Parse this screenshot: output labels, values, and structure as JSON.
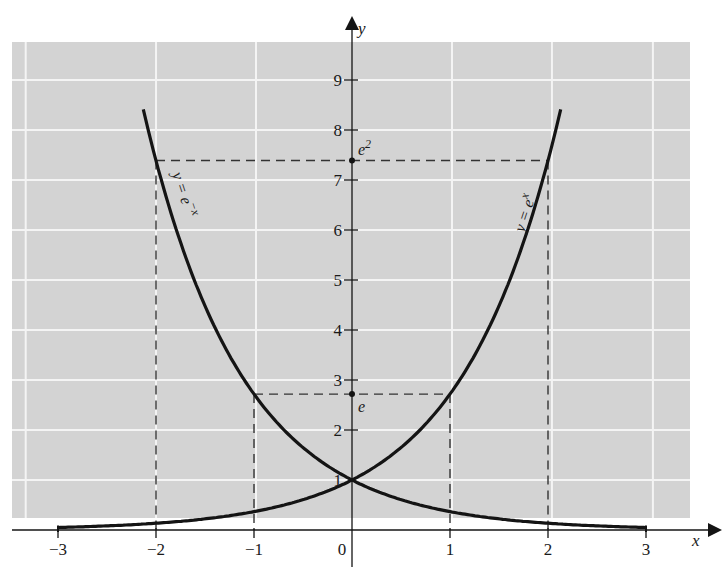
{
  "chart_data": {
    "type": "line",
    "title": "",
    "xlabel": "x",
    "ylabel": "y",
    "xlim": [
      -3,
      3
    ],
    "ylim": [
      0,
      9.5
    ],
    "grid": true,
    "x_ticks": [
      "-3",
      "-2",
      "-1",
      "0",
      "1",
      "2",
      "3"
    ],
    "y_ticks": [
      "1",
      "2",
      "3",
      "4",
      "5",
      "6",
      "7",
      "8",
      "9"
    ],
    "series": [
      {
        "name": "y = e^x",
        "label": "y = e",
        "label_sup": "x",
        "x": [
          -3,
          -2,
          -1,
          0,
          1,
          2,
          2.15
        ],
        "values": [
          0.05,
          0.135,
          0.368,
          1,
          2.718,
          7.389,
          8.6
        ]
      },
      {
        "name": "y = e^-x",
        "label": "y = e",
        "label_sup": "−x",
        "x": [
          -2.15,
          -2,
          -1,
          0,
          1,
          2,
          3
        ],
        "values": [
          8.6,
          7.389,
          2.718,
          1,
          0.368,
          0.135,
          0.05
        ]
      }
    ],
    "annotations": [
      {
        "text": "e",
        "sup": "2",
        "x": 0,
        "y": 7.389,
        "guides": [
          -2,
          2
        ]
      },
      {
        "text": "e",
        "sup": "",
        "x": 0,
        "y": 2.718,
        "guides": [
          -1,
          1
        ]
      }
    ]
  },
  "colors": {
    "background": "#ffffff",
    "panel": "#d3d3d3",
    "grid": "#f4f4f4",
    "ink": "#141414"
  }
}
